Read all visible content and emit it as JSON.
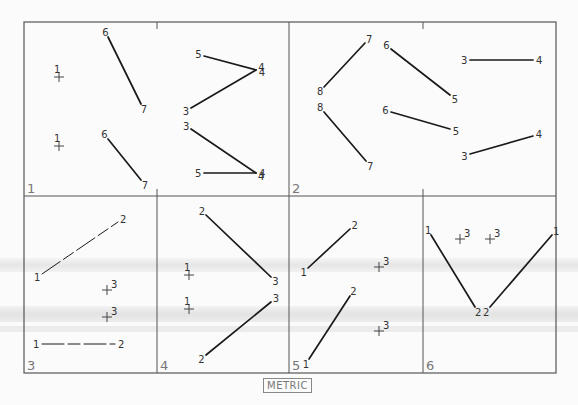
{
  "figure": {
    "unit_label": "METRIC",
    "panels": [
      {
        "id": "1",
        "label": "1",
        "crosses": [
          {
            "label": "1",
            "x": 59,
            "y": 77,
            "label_pos": "above"
          },
          {
            "label": "1",
            "x": 59,
            "y": 146,
            "label_pos": "above"
          }
        ],
        "segments": [
          {
            "a": {
              "label": "6",
              "x": 108,
              "y": 37
            },
            "b": {
              "label": "7",
              "x": 141,
              "y": 104
            }
          },
          {
            "a": {
              "label": "6",
              "x": 108,
              "y": 139
            },
            "b": {
              "label": "7",
              "x": 141,
              "y": 180
            }
          },
          {
            "a": {
              "label": "5",
              "x": 204,
              "y": 56
            },
            "b": {
              "label": "4",
              "x": 256,
              "y": 70
            }
          },
          {
            "a": {
              "label": "3",
              "x": 191,
              "y": 108
            },
            "b": {
              "label": "4",
              "x": 256,
              "y": 70
            }
          },
          {
            "a": {
              "label": "3",
              "x": 191,
              "y": 129
            },
            "b": {
              "label": "4",
              "x": 256,
              "y": 173
            }
          },
          {
            "a": {
              "label": "5",
              "x": 204,
              "y": 173
            },
            "b": {
              "label": "4",
              "x": 256,
              "y": 173
            }
          }
        ]
      },
      {
        "id": "2",
        "label": "2",
        "crosses": [],
        "segments": [
          {
            "a": {
              "label": "8",
              "x": 324,
              "y": 87
            },
            "b": {
              "label": "7",
              "x": 365,
              "y": 43
            }
          },
          {
            "a": {
              "label": "8",
              "x": 324,
              "y": 112
            },
            "b": {
              "label": "7",
              "x": 366,
              "y": 161
            }
          },
          {
            "a": {
              "label": "6",
              "x": 391,
              "y": 49
            },
            "b": {
              "label": "5",
              "x": 450,
              "y": 95
            }
          },
          {
            "a": {
              "label": "6",
              "x": 391,
              "y": 112
            },
            "b": {
              "label": "5",
              "x": 450,
              "y": 129
            }
          },
          {
            "a": {
              "label": "3",
              "x": 470,
              "y": 60
            },
            "b": {
              "label": "4",
              "x": 533,
              "y": 60
            }
          },
          {
            "a": {
              "label": "3",
              "x": 470,
              "y": 154
            },
            "b": {
              "label": "4",
              "x": 533,
              "y": 136
            }
          }
        ]
      },
      {
        "id": "3",
        "label": "3",
        "crosses": [
          {
            "label": "3",
            "x": 107,
            "y": 290,
            "label_pos": "right"
          },
          {
            "label": "3",
            "x": 107,
            "y": 317,
            "label_pos": "right"
          }
        ],
        "segments": [
          {
            "a": {
              "label": "1",
              "x": 42,
              "y": 274
            },
            "b": {
              "label": "2",
              "x": 118,
              "y": 222
            },
            "style": "dashed"
          },
          {
            "a": {
              "label": "1",
              "x": 42,
              "y": 344
            },
            "b": {
              "label": "2",
              "x": 115,
              "y": 344
            },
            "style": "dashed"
          }
        ]
      },
      {
        "id": "4",
        "label": "4",
        "crosses": [
          {
            "label": "1",
            "x": 189,
            "y": 275,
            "label_pos": "above"
          },
          {
            "label": "1",
            "x": 189,
            "y": 309,
            "label_pos": "above"
          }
        ],
        "segments": [
          {
            "a": {
              "label": "2",
              "x": 206,
              "y": 215
            },
            "b": {
              "label": "3",
              "x": 271,
              "y": 277
            }
          },
          {
            "a": {
              "label": "2",
              "x": 206,
              "y": 355
            },
            "b": {
              "label": "3",
              "x": 271,
              "y": 302
            }
          }
        ]
      },
      {
        "id": "5",
        "label": "5",
        "crosses": [
          {
            "label": "3",
            "x": 379,
            "y": 267,
            "label_pos": "right"
          },
          {
            "label": "3",
            "x": 379,
            "y": 331,
            "label_pos": "right"
          }
        ],
        "segments": [
          {
            "a": {
              "label": "1",
              "x": 308,
              "y": 268
            },
            "b": {
              "label": "2",
              "x": 350,
              "y": 229
            }
          },
          {
            "a": {
              "label": "1",
              "x": 309,
              "y": 359
            },
            "b": {
              "label": "2",
              "x": 350,
              "y": 296
            }
          }
        ]
      },
      {
        "id": "6",
        "label": "6",
        "crosses": [
          {
            "label": "3",
            "x": 460,
            "y": 239,
            "label_pos": "right"
          },
          {
            "label": "3",
            "x": 490,
            "y": 239,
            "label_pos": "right"
          }
        ],
        "segments": [
          {
            "a": {
              "label": "1",
              "x": 431,
              "y": 235
            },
            "b": {
              "label": "2",
              "x": 475,
              "y": 307
            }
          },
          {
            "a": {
              "label": "1",
              "x": 552,
              "y": 235
            },
            "b": {
              "label": "2",
              "x": 490,
              "y": 307
            }
          }
        ]
      }
    ]
  }
}
